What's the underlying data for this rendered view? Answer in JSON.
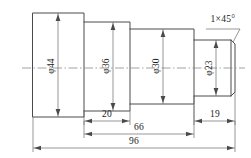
{
  "drawing": {
    "type": "mechanical-part-drawing",
    "subject": "stepped-shaft",
    "projection": "front-view-half-section",
    "units": "mm",
    "diameters": [
      {
        "id": "d1",
        "label": "φ44",
        "value": 44,
        "orientation": "vertical"
      },
      {
        "id": "d2",
        "label": "φ36",
        "value": 36,
        "orientation": "vertical"
      },
      {
        "id": "d3",
        "label": "φ30",
        "value": 30,
        "orientation": "vertical"
      },
      {
        "id": "d4",
        "label": "φ23",
        "value": 23,
        "orientation": "vertical"
      }
    ],
    "lengths": [
      {
        "id": "L20",
        "label": "20",
        "value": 20,
        "orientation": "horizontal"
      },
      {
        "id": "L66",
        "label": "66",
        "value": 66,
        "orientation": "horizontal"
      },
      {
        "id": "L19",
        "label": "19",
        "value": 19,
        "orientation": "horizontal"
      },
      {
        "id": "L96",
        "label": "96",
        "value": 96,
        "orientation": "horizontal",
        "overall": true
      }
    ],
    "notes": [
      {
        "id": "chamfer",
        "label": "1×45°",
        "meaning": "chamfer 1 mm at 45 degrees"
      }
    ],
    "colors": {
      "outline": "#4a4a4a",
      "dimension": "#6a6a6a",
      "centerline": "#8a8a8a",
      "text": "#1a1a1a",
      "background": "#ffffff"
    }
  }
}
